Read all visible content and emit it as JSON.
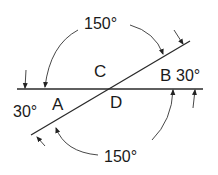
{
  "diagram": {
    "type": "angle-diagram",
    "points": [
      {
        "label": "A",
        "x": 59,
        "y": 110
      },
      {
        "label": "B",
        "x": 160,
        "y": 81
      },
      {
        "label": "C",
        "x": 94,
        "y": 77
      },
      {
        "label": "D",
        "x": 110,
        "y": 108
      }
    ],
    "angles": [
      {
        "label": "150°",
        "position": "top",
        "x": 107,
        "y": 29
      },
      {
        "label": "30°",
        "position": "right",
        "x": 176,
        "y": 81
      },
      {
        "label": "30°",
        "position": "left",
        "x": 13,
        "y": 113
      },
      {
        "label": "150°",
        "position": "bottom",
        "x": 104,
        "y": 159
      }
    ],
    "colors": {
      "line": "#2a2a2a",
      "text": "#1a1a1a",
      "background": "#ffffff"
    }
  }
}
